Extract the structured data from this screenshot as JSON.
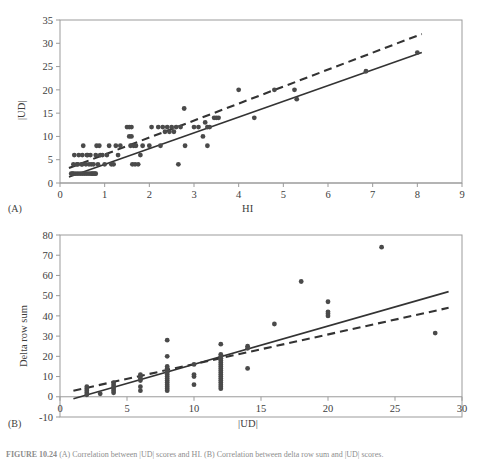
{
  "figure": {
    "caption_prefix": "FIGURE 10.24",
    "caption_text": "(A) Correlation between |UD| scores and HI. (B) Correlation between delta row sum and |UD| scores."
  },
  "panel_a": {
    "label": "(A)",
    "xlabel": "HI",
    "ylabel": "|UD|"
  },
  "panel_b": {
    "label": "(B)",
    "xlabel": "|UD|",
    "ylabel": "Delta row sum"
  },
  "style": {
    "marker_color": "#4a4a4a",
    "line_color": "#333333",
    "frame_color": "#9b9b9b",
    "text_color": "#3d3d3d"
  },
  "chart_data": [
    {
      "id": "panel_a",
      "type": "scatter",
      "title": "",
      "xlabel": "HI",
      "ylabel": "|UD|",
      "xlim": [
        0,
        9
      ],
      "ylim": [
        0,
        35
      ],
      "xticks": [
        0,
        1,
        2,
        3,
        4,
        5,
        6,
        7,
        8,
        9
      ],
      "yticks": [
        0,
        5,
        10,
        15,
        20,
        25,
        30,
        35
      ],
      "grid": false,
      "legend": "none",
      "points": [
        [
          0.25,
          2
        ],
        [
          0.28,
          2
        ],
        [
          0.3,
          2
        ],
        [
          0.3,
          4
        ],
        [
          0.32,
          6
        ],
        [
          0.35,
          2
        ],
        [
          0.38,
          4
        ],
        [
          0.4,
          2
        ],
        [
          0.4,
          4
        ],
        [
          0.42,
          6
        ],
        [
          0.45,
          2
        ],
        [
          0.48,
          4
        ],
        [
          0.5,
          2
        ],
        [
          0.5,
          4
        ],
        [
          0.5,
          6
        ],
        [
          0.52,
          8
        ],
        [
          0.55,
          2
        ],
        [
          0.58,
          4
        ],
        [
          0.6,
          2
        ],
        [
          0.6,
          6
        ],
        [
          0.62,
          6
        ],
        [
          0.65,
          2
        ],
        [
          0.65,
          4
        ],
        [
          0.68,
          6
        ],
        [
          0.7,
          2
        ],
        [
          0.7,
          4
        ],
        [
          0.72,
          2
        ],
        [
          0.75,
          2
        ],
        [
          0.75,
          4
        ],
        [
          0.78,
          2
        ],
        [
          0.8,
          2
        ],
        [
          0.8,
          6
        ],
        [
          0.82,
          8
        ],
        [
          0.85,
          4
        ],
        [
          0.88,
          8
        ],
        [
          0.9,
          6
        ],
        [
          0.95,
          6
        ],
        [
          1.0,
          4
        ],
        [
          1.05,
          6
        ],
        [
          1.1,
          8
        ],
        [
          1.15,
          4
        ],
        [
          1.2,
          4
        ],
        [
          1.25,
          8
        ],
        [
          1.3,
          6
        ],
        [
          1.35,
          8
        ],
        [
          1.5,
          12
        ],
        [
          1.55,
          12
        ],
        [
          1.55,
          10
        ],
        [
          1.58,
          8
        ],
        [
          1.6,
          12
        ],
        [
          1.6,
          10
        ],
        [
          1.62,
          4
        ],
        [
          1.65,
          8
        ],
        [
          1.68,
          4
        ],
        [
          1.7,
          8
        ],
        [
          1.75,
          4
        ],
        [
          1.8,
          6
        ],
        [
          1.85,
          8
        ],
        [
          2.0,
          8
        ],
        [
          2.05,
          12
        ],
        [
          2.2,
          12
        ],
        [
          2.25,
          8
        ],
        [
          2.3,
          12
        ],
        [
          2.35,
          11
        ],
        [
          2.4,
          12
        ],
        [
          2.45,
          11
        ],
        [
          2.5,
          12
        ],
        [
          2.55,
          11
        ],
        [
          2.6,
          12
        ],
        [
          2.65,
          4
        ],
        [
          2.7,
          12
        ],
        [
          2.78,
          16
        ],
        [
          2.8,
          8
        ],
        [
          3.0,
          12
        ],
        [
          3.1,
          12
        ],
        [
          3.2,
          10
        ],
        [
          3.25,
          13
        ],
        [
          3.3,
          12
        ],
        [
          3.3,
          8
        ],
        [
          3.35,
          12
        ],
        [
          3.45,
          14
        ],
        [
          3.5,
          14
        ],
        [
          3.55,
          14
        ],
        [
          4.0,
          20
        ],
        [
          4.35,
          14
        ],
        [
          4.8,
          20
        ],
        [
          5.25,
          20
        ],
        [
          5.3,
          18
        ],
        [
          6.85,
          24
        ],
        [
          8.0,
          28
        ]
      ],
      "lines": [
        {
          "name": "solid-fit",
          "style": "solid",
          "x": [
            0.2,
            8.1
          ],
          "y": [
            1.3,
            28.0
          ]
        },
        {
          "name": "dashed-fit",
          "style": "dashed",
          "x": [
            0.2,
            8.1
          ],
          "y": [
            3.2,
            32.0
          ]
        }
      ]
    },
    {
      "id": "panel_b",
      "type": "scatter",
      "title": "",
      "xlabel": "|UD|",
      "ylabel": "Delta row sum",
      "xlim": [
        0,
        30
      ],
      "ylim": [
        -10,
        80
      ],
      "xticks": [
        0,
        5,
        10,
        15,
        20,
        25,
        30
      ],
      "yticks": [
        -10,
        0,
        10,
        20,
        30,
        40,
        50,
        60,
        70,
        80
      ],
      "grid": false,
      "legend": "none",
      "points": [
        [
          2,
          1
        ],
        [
          2,
          2
        ],
        [
          2,
          3
        ],
        [
          2,
          4
        ],
        [
          2,
          5
        ],
        [
          3,
          1.5
        ],
        [
          4,
          2
        ],
        [
          4,
          3
        ],
        [
          4,
          4
        ],
        [
          4,
          5
        ],
        [
          4,
          6
        ],
        [
          4,
          7
        ],
        [
          6,
          3
        ],
        [
          6,
          5
        ],
        [
          6,
          8
        ],
        [
          6,
          9
        ],
        [
          6,
          10
        ],
        [
          6,
          11
        ],
        [
          8,
          3
        ],
        [
          8,
          4
        ],
        [
          8,
          5
        ],
        [
          8,
          6
        ],
        [
          8,
          7
        ],
        [
          8,
          8
        ],
        [
          8,
          9
        ],
        [
          8,
          10
        ],
        [
          8,
          11
        ],
        [
          8,
          12
        ],
        [
          8,
          13
        ],
        [
          8,
          14
        ],
        [
          8,
          15
        ],
        [
          8,
          20
        ],
        [
          8,
          28
        ],
        [
          10,
          6
        ],
        [
          10,
          10
        ],
        [
          10,
          11
        ],
        [
          10,
          16
        ],
        [
          12,
          4
        ],
        [
          12,
          5
        ],
        [
          12,
          6
        ],
        [
          12,
          7
        ],
        [
          12,
          8
        ],
        [
          12,
          9
        ],
        [
          12,
          10
        ],
        [
          12,
          11
        ],
        [
          12,
          12
        ],
        [
          12,
          13
        ],
        [
          12,
          14
        ],
        [
          12,
          15
        ],
        [
          12,
          16
        ],
        [
          12,
          17
        ],
        [
          12,
          18
        ],
        [
          12,
          19
        ],
        [
          12,
          20
        ],
        [
          12,
          21
        ],
        [
          12,
          26
        ],
        [
          14,
          14
        ],
        [
          14,
          24
        ],
        [
          14,
          25
        ],
        [
          16,
          36
        ],
        [
          18,
          57
        ],
        [
          20,
          40
        ],
        [
          20,
          41
        ],
        [
          20,
          42
        ],
        [
          20,
          47
        ],
        [
          24,
          74
        ],
        [
          28,
          31.5
        ]
      ],
      "lines": [
        {
          "name": "solid-fit",
          "style": "solid",
          "x": [
            1.0,
            29.0
          ],
          "y": [
            -1.0,
            52.0
          ]
        },
        {
          "name": "dashed-fit",
          "style": "dashed",
          "x": [
            1.0,
            29.0
          ],
          "y": [
            3.0,
            44.0
          ]
        }
      ]
    }
  ]
}
